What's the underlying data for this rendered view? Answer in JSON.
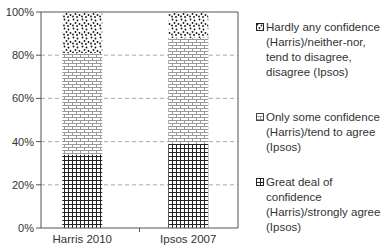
{
  "chart_data": {
    "type": "bar",
    "stacked": true,
    "percent": true,
    "title": "",
    "xlabel": "",
    "ylabel": "",
    "ylim": [
      0,
      100
    ],
    "yticks": [
      "0%",
      "20%",
      "40%",
      "60%",
      "80%",
      "100%"
    ],
    "ytick_values": [
      0,
      20,
      40,
      60,
      80,
      100
    ],
    "grid": "horizontal dashed",
    "legend_position": "right",
    "categories": [
      "Harris 2010",
      "Ipsos 2007"
    ],
    "series": [
      {
        "name": "Great deal of confidence (Harris)/strongly agree (Ipsos)",
        "pattern": "grid",
        "values": [
          34,
          39
        ]
      },
      {
        "name": "Only some confidence (Harris)/tend to agree (Ipsos)",
        "pattern": "brick",
        "values": [
          47,
          49
        ]
      },
      {
        "name": "Hardly any confidence (Harris)/neither-nor, tend to disagree, disagree (Ipsos)",
        "pattern": "dots",
        "values": [
          19,
          12
        ]
      }
    ]
  },
  "legend": {
    "items": [
      {
        "text": "Hardly any confidence\n(Harris)/neither-nor,\ntend to disagree,\ndisagree (Ipsos)",
        "pattern": "dots"
      },
      {
        "text": "Only some confidence\n(Harris)/tend to agree\n(Ipsos)",
        "pattern": "brick"
      },
      {
        "text": "Great deal of confidence\n(Harris)/strongly agree\n(Ipsos)",
        "pattern": "grid"
      }
    ]
  },
  "colors": {
    "axis": "#555555",
    "gridline": "#aaaaaa",
    "grid_pattern": "#222222",
    "brick_pattern": "#9a9a9a",
    "dots_pattern": "#111111"
  }
}
